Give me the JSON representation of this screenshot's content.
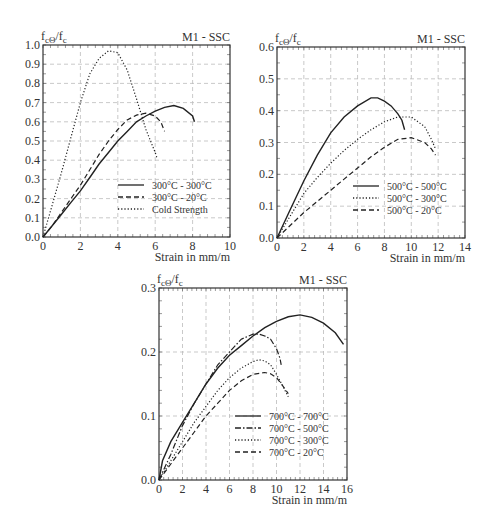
{
  "chart_data": [
    {
      "type": "line",
      "id": "chart-300",
      "title": "M1 - SSC",
      "ylabel": "fcΘ/fc",
      "xlabel": "Strain in mm/m",
      "xlim": [
        0,
        10
      ],
      "ylim": [
        0,
        1.0
      ],
      "xticks": [
        0,
        2,
        4,
        6,
        8,
        10
      ],
      "yticks": [
        0.0,
        0.1,
        0.2,
        0.3,
        0.4,
        0.5,
        0.6,
        0.7,
        0.8,
        0.9,
        1.0
      ],
      "ytick_labels": [
        "0.0",
        "0.1",
        "0.2",
        "0.3",
        "0.4",
        "0.5",
        "0.6",
        "0.7",
        "0.8",
        "0.9",
        "1.0"
      ],
      "grid": true,
      "legend_position": "lower right",
      "box": {
        "left": 43,
        "top": 45,
        "right": 230,
        "bottom": 237
      },
      "series": [
        {
          "name": "300°C - 300°C",
          "style": "solid",
          "x": [
            0,
            0.5,
            1,
            1.5,
            2,
            2.5,
            3,
            3.5,
            4,
            4.5,
            5,
            5.5,
            6,
            6.5,
            7,
            7.5,
            8,
            8.1
          ],
          "y": [
            0,
            0.06,
            0.12,
            0.18,
            0.24,
            0.31,
            0.38,
            0.44,
            0.5,
            0.55,
            0.6,
            0.63,
            0.655,
            0.675,
            0.685,
            0.67,
            0.63,
            0.6
          ]
        },
        {
          "name": "300°C - 20°C",
          "style": "dashed",
          "x": [
            0,
            0.5,
            1,
            1.5,
            2,
            2.5,
            3,
            3.5,
            4,
            4.5,
            5,
            5.5,
            6,
            6.3,
            6.5
          ],
          "y": [
            0,
            0.06,
            0.13,
            0.2,
            0.27,
            0.35,
            0.43,
            0.5,
            0.56,
            0.61,
            0.635,
            0.645,
            0.63,
            0.6,
            0.55
          ]
        },
        {
          "name": "Cold Strength",
          "style": "dotted",
          "x": [
            0,
            0.5,
            1,
            1.5,
            2,
            2.5,
            3,
            3.5,
            4,
            4.5,
            5,
            5.5,
            6,
            6.1
          ],
          "y": [
            0,
            0.17,
            0.34,
            0.52,
            0.7,
            0.85,
            0.93,
            0.97,
            0.96,
            0.87,
            0.72,
            0.56,
            0.44,
            0.41
          ]
        }
      ]
    },
    {
      "type": "line",
      "id": "chart-500",
      "title": "M1 - SSC",
      "ylabel": "fcΘ/fc",
      "xlabel": "Strain in mm/m",
      "xlim": [
        0,
        14
      ],
      "ylim": [
        0,
        0.6
      ],
      "xticks": [
        0,
        2,
        4,
        6,
        8,
        10,
        12,
        14
      ],
      "yticks": [
        0.0,
        0.1,
        0.2,
        0.3,
        0.4,
        0.5,
        0.6
      ],
      "ytick_labels": [
        "0.0",
        "0.1",
        "0.2",
        "0.3",
        "0.4",
        "0.5",
        "0.6"
      ],
      "grid": true,
      "legend_position": "lower right",
      "box": {
        "left": 277,
        "top": 47,
        "right": 465,
        "bottom": 238
      },
      "series": [
        {
          "name": "500°C - 500°C",
          "style": "solid",
          "x": [
            0,
            1,
            2,
            3,
            4,
            5,
            6,
            7,
            7.5,
            8,
            8.5,
            9,
            9.3,
            9.5
          ],
          "y": [
            0,
            0.09,
            0.18,
            0.26,
            0.33,
            0.38,
            0.415,
            0.44,
            0.44,
            0.43,
            0.415,
            0.39,
            0.37,
            0.34
          ]
        },
        {
          "name": "500°C - 300°C",
          "style": "dotted",
          "x": [
            0,
            1,
            2,
            3,
            4,
            5,
            6,
            7,
            8,
            9,
            10,
            11,
            11.5,
            11.8
          ],
          "y": [
            0,
            0.07,
            0.14,
            0.19,
            0.235,
            0.275,
            0.31,
            0.34,
            0.365,
            0.38,
            0.38,
            0.35,
            0.31,
            0.28
          ]
        },
        {
          "name": "500°C - 20°C",
          "style": "dashed",
          "x": [
            0,
            1,
            2,
            3,
            4,
            5,
            6,
            7,
            8,
            9,
            10,
            11,
            11.5,
            11.8
          ],
          "y": [
            0,
            0.04,
            0.08,
            0.115,
            0.15,
            0.185,
            0.22,
            0.255,
            0.285,
            0.31,
            0.315,
            0.3,
            0.28,
            0.26
          ]
        }
      ]
    },
    {
      "type": "line",
      "id": "chart-700",
      "title": "M1 - SSC",
      "ylabel": "fcΘ/fc",
      "xlabel": "Strain in mm/m",
      "xlim": [
        0,
        16
      ],
      "ylim": [
        0,
        0.3
      ],
      "xticks": [
        0,
        2,
        4,
        6,
        8,
        10,
        12,
        14,
        16
      ],
      "yticks": [
        0.0,
        0.1,
        0.2,
        0.3
      ],
      "ytick_labels": [
        "0.0",
        "0.1",
        "0.2",
        "0.3"
      ],
      "grid": true,
      "legend_position": "lower right",
      "box": {
        "left": 159,
        "top": 288,
        "right": 347,
        "bottom": 480
      },
      "series": [
        {
          "name": "700°C - 700°C",
          "style": "solid",
          "x": [
            0,
            0.3,
            1,
            2,
            3,
            4,
            5,
            6,
            7,
            8,
            9,
            10,
            11,
            12,
            13,
            14,
            15,
            15.7
          ],
          "y": [
            0,
            0.03,
            0.06,
            0.09,
            0.12,
            0.15,
            0.175,
            0.195,
            0.21,
            0.225,
            0.238,
            0.248,
            0.255,
            0.258,
            0.254,
            0.245,
            0.23,
            0.212
          ]
        },
        {
          "name": "700°C - 500°C",
          "style": "dashdot",
          "x": [
            0,
            1,
            2,
            3,
            4,
            5,
            6,
            7,
            8,
            8.5,
            9,
            9.5,
            10,
            10.3,
            10.4
          ],
          "y": [
            0,
            0.04,
            0.085,
            0.12,
            0.15,
            0.18,
            0.2,
            0.22,
            0.228,
            0.228,
            0.225,
            0.22,
            0.205,
            0.19,
            0.18
          ]
        },
        {
          "name": "700°C - 300°C",
          "style": "dotted",
          "x": [
            0,
            1,
            2,
            3,
            4,
            5,
            6,
            7,
            8,
            8.5,
            9,
            9.5,
            10,
            10.5,
            11
          ],
          "y": [
            0,
            0.03,
            0.06,
            0.09,
            0.115,
            0.14,
            0.16,
            0.175,
            0.185,
            0.188,
            0.186,
            0.18,
            0.165,
            0.148,
            0.13
          ]
        },
        {
          "name": "700°C - 20°C",
          "style": "dashed",
          "x": [
            0,
            1,
            2,
            3,
            4,
            5,
            6,
            7,
            8,
            9,
            9.5,
            10,
            10.5,
            11
          ],
          "y": [
            0,
            0.025,
            0.05,
            0.075,
            0.1,
            0.12,
            0.14,
            0.155,
            0.165,
            0.168,
            0.166,
            0.16,
            0.148,
            0.135
          ]
        }
      ]
    }
  ]
}
